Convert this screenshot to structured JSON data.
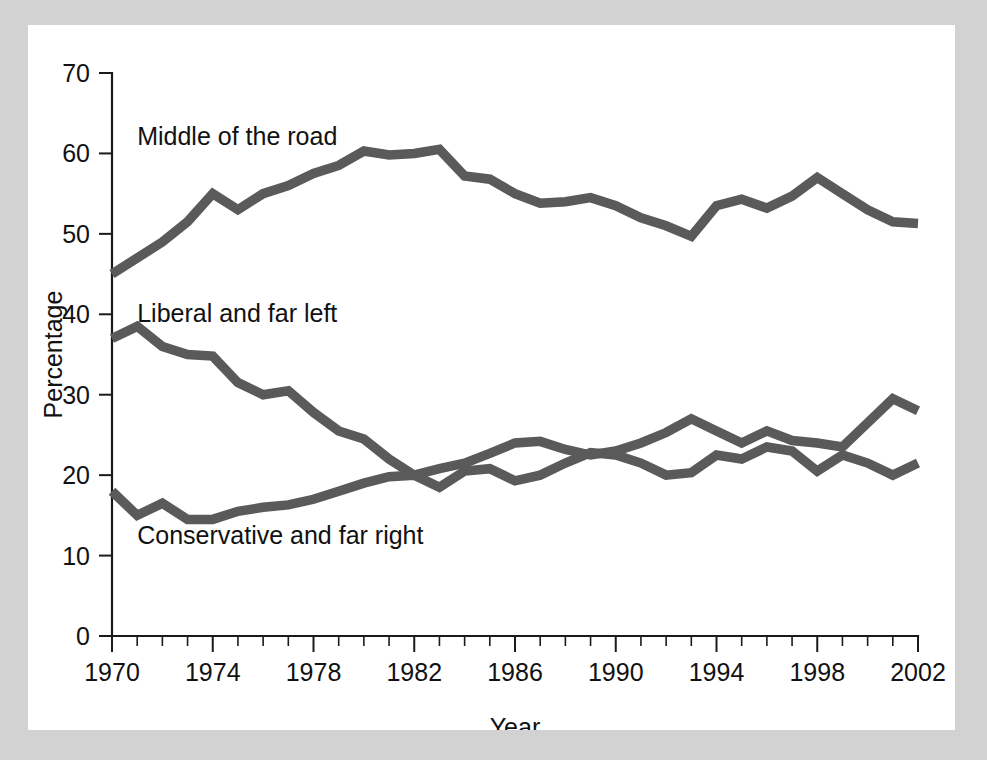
{
  "figure": {
    "background_color": "#d2d2d2",
    "plot_background_color": "#ffffff",
    "line_color": "#5a5a5a",
    "axis_color": "#1a1a1a"
  },
  "chart_data": {
    "type": "line",
    "title": "",
    "xlabel": "Year",
    "ylabel": "Percentage",
    "xlim": [
      1970,
      2002
    ],
    "ylim": [
      0,
      70
    ],
    "ytick_labels": [
      "0",
      "10",
      "20",
      "30",
      "40",
      "50",
      "60",
      "70"
    ],
    "ytick_values": [
      0,
      10,
      20,
      30,
      40,
      50,
      60,
      70
    ],
    "xtick_labels": [
      "1970",
      "1974",
      "1978",
      "1982",
      "1986",
      "1990",
      "1994",
      "1998",
      "2002"
    ],
    "xtick_values": [
      1970,
      1974,
      1978,
      1982,
      1986,
      1990,
      1994,
      1998,
      2002
    ],
    "x_minor_interval": 1,
    "grid": false,
    "legend_position": "inline-annotations",
    "x": [
      1970,
      1971,
      1972,
      1973,
      1974,
      1975,
      1976,
      1977,
      1978,
      1979,
      1980,
      1981,
      1982,
      1983,
      1984,
      1985,
      1986,
      1987,
      1988,
      1989,
      1990,
      1991,
      1992,
      1993,
      1994,
      1995,
      1996,
      1997,
      1998,
      1999,
      2000,
      2001,
      2002
    ],
    "series": [
      {
        "name": "Middle of the road",
        "label": "Middle of the road",
        "color": "#5a5a5a",
        "label_x": 1971.0,
        "label_y": 61.0,
        "values": [
          45.0,
          47.0,
          49.0,
          51.5,
          55.0,
          53.0,
          55.0,
          56.0,
          57.5,
          58.5,
          60.3,
          59.8,
          60.0,
          60.5,
          57.2,
          56.8,
          55.0,
          53.8,
          54.0,
          54.5,
          53.5,
          52.0,
          51.0,
          49.7,
          53.5,
          54.3,
          53.2,
          54.7,
          57.0,
          55.0,
          53.0,
          51.5,
          51.3
        ]
      },
      {
        "name": "Liberal and far left",
        "label": "Liberal and far left",
        "color": "#5a5a5a",
        "label_x": 1971.0,
        "label_y": 39.0,
        "values": [
          37.0,
          38.5,
          36.0,
          35.0,
          34.8,
          31.5,
          30.0,
          30.5,
          27.8,
          25.5,
          24.5,
          22.0,
          20.0,
          20.8,
          21.5,
          22.7,
          24.0,
          24.2,
          23.2,
          22.5,
          23.0,
          24.0,
          25.3,
          27.0,
          25.5,
          24.0,
          25.5,
          24.3,
          24.0,
          23.5,
          26.5,
          29.5,
          28.0
        ]
      },
      {
        "name": "Conservative and far right",
        "label": "Conservative and far right",
        "color": "#5a5a5a",
        "label_x": 1971.0,
        "label_y": 11.5,
        "values": [
          18.0,
          15.0,
          16.5,
          14.5,
          14.5,
          15.5,
          16.0,
          16.3,
          17.0,
          18.0,
          19.0,
          19.8,
          20.0,
          18.5,
          20.5,
          20.8,
          19.3,
          20.0,
          21.5,
          22.8,
          22.5,
          21.5,
          20.0,
          20.3,
          22.5,
          22.0,
          23.5,
          23.0,
          20.5,
          22.5,
          21.5,
          20.0,
          21.5
        ]
      }
    ]
  }
}
